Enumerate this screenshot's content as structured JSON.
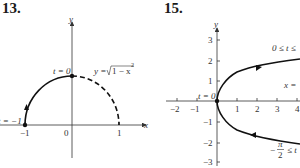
{
  "figures": [
    {
      "number": "13.",
      "axis_x_label": "x",
      "axis_y_label": "y",
      "tick_labels": {
        "neg_one": "−1",
        "zero": "0",
        "one": "1"
      },
      "annotations": {
        "start": "t = −1",
        "top": "t = 0",
        "curve_eq_prefix": "y = ",
        "curve_eq_radicand": "1 − x",
        "curve_eq_exp": "2"
      },
      "curve": {
        "solid": "left quarter arc from (-1,0) to (0,1)",
        "dashed": "right quarter arc from (0,1) to (1,0)"
      }
    },
    {
      "number": "15.",
      "axis_x_label": "x",
      "axis_y_label": "y",
      "x_ticks": [
        "−2",
        "−1",
        "1",
        "2",
        "3",
        "4"
      ],
      "y_ticks": [
        "3",
        "2",
        "1",
        "−1",
        "−2",
        "−3"
      ],
      "annotations": {
        "origin": "t = 0",
        "upper_range": "0 ≤ t ≤",
        "curve_eq": "x =",
        "lower_range_num": "π",
        "lower_range_den": "2",
        "lower_range_prefix": "−",
        "lower_range_suffix": "≤ t"
      }
    }
  ],
  "colors": {
    "curve": "#111111",
    "axes": "#333333",
    "text": "#1a1a1a"
  }
}
